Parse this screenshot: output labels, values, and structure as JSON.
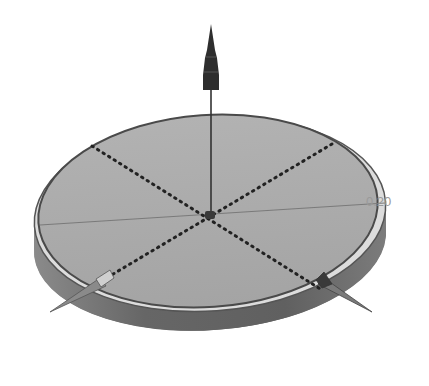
{
  "diagram": {
    "type": "3d-cad-render",
    "dimension_label": "0.20",
    "colors": {
      "background": "#ffffff",
      "top_face": "#a9a9a9",
      "side_face": "#6e6e6e",
      "rim_highlight": "#e2e2e2",
      "outline": "#4a4a4a",
      "dotted_lines": "#2a2a2a",
      "arrow": "#2e2e2e"
    },
    "elements": [
      {
        "name": "disc-top-face"
      },
      {
        "name": "disc-side-wall"
      },
      {
        "name": "rim-highlight"
      },
      {
        "name": "vertical-axis-arrow"
      },
      {
        "name": "center-point"
      },
      {
        "name": "dotted-diagonal-line-1"
      },
      {
        "name": "dotted-diagonal-line-2"
      },
      {
        "name": "horizontal-reference-line"
      },
      {
        "name": "left-spike-arrow"
      },
      {
        "name": "right-spike-arrow"
      },
      {
        "name": "dimension-label"
      }
    ]
  }
}
